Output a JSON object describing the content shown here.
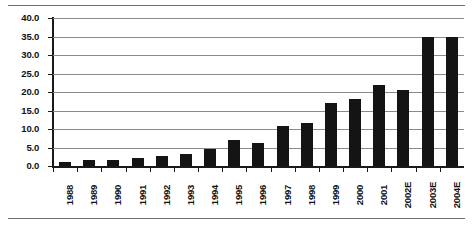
{
  "chart_data": {
    "type": "bar",
    "title": "",
    "subtitle": "",
    "xlabel": "",
    "ylabel": "",
    "ylim": [
      0.0,
      40.0
    ],
    "ytick_step": 5.0,
    "ytick_labels": [
      "40.0",
      "35.0",
      "30.0",
      "25.0",
      "20.0",
      "15.0",
      "10.0",
      "5.0",
      "0.0"
    ],
    "ytick_values": [
      40.0,
      35.0,
      30.0,
      25.0,
      20.0,
      15.0,
      10.0,
      5.0,
      0.0
    ],
    "grid": true,
    "grid_axis": "y",
    "legend": false,
    "legend_position": "none",
    "bar_color": "#141414",
    "gridline_color": "#8a8a8a",
    "axis_color": "#1a1a1a",
    "categories": [
      "1988",
      "1989",
      "1990",
      "1991",
      "1992",
      "1993",
      "1994",
      "1995",
      "1996",
      "1997",
      "1998",
      "1999",
      "2000",
      "2001",
      "2002E",
      "2003E",
      "2004E"
    ],
    "values": [
      1.0,
      1.5,
      1.7,
      2.3,
      2.6,
      3.3,
      4.5,
      7.0,
      6.2,
      10.8,
      11.6,
      17.0,
      18.0,
      22.0,
      20.5,
      35.0,
      35.0
    ],
    "annotations": []
  }
}
